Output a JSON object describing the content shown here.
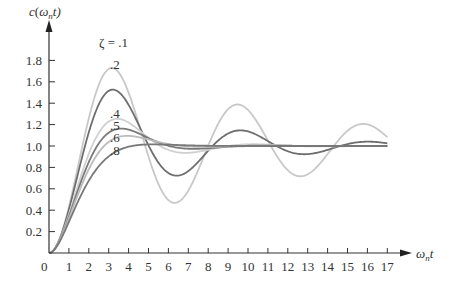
{
  "chart_data": {
    "type": "line",
    "title": "",
    "xlabel": "ω_n t",
    "ylabel": "c(ω_n t)",
    "xlim": [
      0,
      17
    ],
    "ylim": [
      0,
      1.8
    ],
    "grid": false,
    "legend_position": "inline labels near peaks",
    "x_ticks": [
      "0",
      "1",
      "2",
      "3",
      "4",
      "5",
      "6",
      "7",
      "8",
      "9",
      "10",
      "11",
      "12",
      "13",
      "14",
      "15",
      "16",
      "17"
    ],
    "y_ticks": [
      "0.2",
      "0.4",
      "0.6",
      "0.8",
      "1.0",
      "1.2",
      "1.4",
      "1.6",
      "1.8"
    ],
    "annotations": [
      {
        "text": "ζ = .1",
        "series": "ζ=0.1"
      },
      {
        "text": ".2",
        "series": "ζ=0.2"
      },
      {
        "text": ".4",
        "series": "ζ=0.4"
      },
      {
        "text": ".5",
        "series": "ζ=0.5"
      },
      {
        "text": ".6",
        "series": "ζ=0.6"
      },
      {
        "text": ".8",
        "series": "ζ=0.8"
      }
    ],
    "x": [
      0,
      1,
      2,
      3,
      4,
      5,
      6,
      7,
      8,
      9,
      10,
      11,
      12,
      13,
      14,
      15,
      16,
      17
    ],
    "series": [
      {
        "name": "ζ=0.1",
        "zeta": 0.1,
        "color": "#c8c8c8",
        "values": [
          0,
          0.431,
          1.257,
          1.72,
          1.5,
          0.902,
          0.495,
          0.585,
          0.997,
          1.338,
          1.339,
          1.056,
          0.775,
          0.736,
          0.924,
          1.141,
          1.202,
          1.087
        ]
      },
      {
        "name": "ζ=0.2",
        "zeta": 0.2,
        "color": "#6e6e6e",
        "values": [
          0,
          0.405,
          1.127,
          1.516,
          1.385,
          1.006,
          0.747,
          0.766,
          0.957,
          1.118,
          1.136,
          1.047,
          0.953,
          0.924,
          0.963,
          1.018,
          1.04,
          1.025
        ]
      },
      {
        "name": "ζ=0.4",
        "zeta": 0.4,
        "color": "#d0d0d0",
        "values": [
          0,
          0.36,
          0.927,
          1.228,
          1.219,
          1.075,
          0.964,
          0.936,
          0.964,
          0.999,
          1.016,
          1.01,
          1.0,
          1.0,
          1.0,
          1.0,
          1.0,
          1.0
        ]
      },
      {
        "name": "ζ=0.5",
        "zeta": 0.5,
        "color": "#7a7a7a",
        "values": [
          0,
          0.34,
          0.849,
          1.124,
          1.153,
          1.075,
          1.002,
          0.974,
          0.979,
          0.992,
          1.0,
          1.0,
          1.0,
          1.0,
          1.0,
          1.0,
          1.0,
          1.0
        ]
      },
      {
        "name": "ζ=0.6",
        "zeta": 0.6,
        "color": "#bcbcbc",
        "values": [
          0,
          0.322,
          0.783,
          1.038,
          1.094,
          1.061,
          1.018,
          0.995,
          0.994,
          1.0,
          1.0,
          1.0,
          1.0,
          1.0,
          1.0,
          1.0,
          1.0,
          1.0
        ]
      },
      {
        "name": "ζ=0.8",
        "zeta": 0.8,
        "color": "#787878",
        "values": [
          0,
          0.291,
          0.676,
          0.903,
          0.993,
          1.015,
          1.012,
          1.004,
          1.0,
          1.0,
          1.0,
          1.0,
          1.0,
          1.0,
          1.0,
          1.0,
          1.0,
          1.0
        ]
      }
    ]
  },
  "labels": {
    "ylabel_c": "c",
    "ylabel_open": "(",
    "ylabel_omega": "ω",
    "ylabel_n": "n",
    "ylabel_t": "t)",
    "xlabel_omega": "ω",
    "xlabel_n": "n",
    "xlabel_t": "t",
    "origin": "0"
  }
}
